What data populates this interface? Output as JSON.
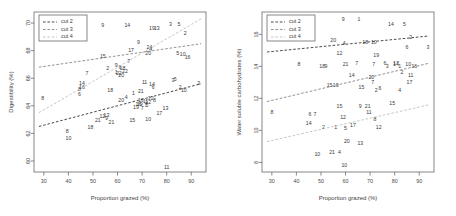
{
  "figure": {
    "panel_count": 2,
    "background": "#ffffff"
  },
  "legend": {
    "items": [
      {
        "label": "cut 2",
        "color": "#2b2b2b"
      },
      {
        "label": "cut 3",
        "color": "#7d7d7d"
      },
      {
        "label": "cut 4",
        "color": "#bcbcbc"
      }
    ]
  },
  "chart_data": [
    {
      "type": "scatter",
      "panel": "left",
      "title": "",
      "xlabel": "Proportion grazed (%)",
      "ylabel": "Digestibility (%)",
      "xlim": [
        26,
        96
      ],
      "ylim": [
        59.2,
        70.8
      ],
      "xticks": [
        30,
        40,
        50,
        60,
        70,
        80,
        90
      ],
      "yticks": [
        60,
        62,
        64,
        66,
        68,
        70
      ],
      "grid": false,
      "legend_position": "top-left",
      "point_label_mode": "numeric-id",
      "series": [
        {
          "name": "cut 2",
          "color": "#2b2b2b",
          "points": [
            {
              "label": "8",
              "x": 39.5,
              "y": 62.1
            },
            {
              "label": "18",
              "x": 49.0,
              "y": 62.4
            },
            {
              "label": "21",
              "x": 57.5,
              "y": 62.8
            },
            {
              "label": "12",
              "x": 53.8,
              "y": 63.2
            },
            {
              "label": "9",
              "x": 55.5,
              "y": 63.1
            },
            {
              "label": "15",
              "x": 66.0,
              "y": 62.9
            },
            {
              "label": "10",
              "x": 72.5,
              "y": 63.0
            },
            {
              "label": "17",
              "x": 77.0,
              "y": 63.4
            },
            {
              "label": "13",
              "x": 79.5,
              "y": 63.8
            },
            {
              "label": "19",
              "x": 67.5,
              "y": 63.9
            },
            {
              "label": "16",
              "x": 68.5,
              "y": 64.1
            },
            {
              "label": "7",
              "x": 70.0,
              "y": 63.8
            },
            {
              "label": "5",
              "x": 72.0,
              "y": 64.0
            },
            {
              "label": "12",
              "x": 72.5,
              "y": 64.2
            },
            {
              "label": "11",
              "x": 71.5,
              "y": 64.3
            },
            {
              "label": "20",
              "x": 61.5,
              "y": 64.4
            },
            {
              "label": "4",
              "x": 63.5,
              "y": 64.6
            },
            {
              "label": "1",
              "x": 66.5,
              "y": 64.9
            },
            {
              "label": "21",
              "x": 69.5,
              "y": 65.0
            },
            {
              "label": "14",
              "x": 74.0,
              "y": 65.5
            },
            {
              "label": "6",
              "x": 74.5,
              "y": 65.3
            },
            {
              "label": "11",
              "x": 71.0,
              "y": 65.7
            },
            {
              "label": "3",
              "x": 82.5,
              "y": 65.8
            },
            {
              "label": "5",
              "x": 83.5,
              "y": 65.9
            },
            {
              "label": "2",
              "x": 85.5,
              "y": 65.3
            },
            {
              "label": "10",
              "x": 87.0,
              "y": 65.1
            },
            {
              "label": "3",
              "x": 93.0,
              "y": 65.6
            },
            {
              "label": "11",
              "x": 80.0,
              "y": 59.5
            }
          ]
        },
        {
          "name": "cut 3",
          "color": "#7d7d7d",
          "points": [
            {
              "label": "8",
              "x": 29.5,
              "y": 64.5
            },
            {
              "label": "8",
              "x": 44.5,
              "y": 65.2
            },
            {
              "label": "14",
              "x": 45.5,
              "y": 65.6
            },
            {
              "label": "7",
              "x": 47.5,
              "y": 66.3
            },
            {
              "label": "2",
              "x": 56.0,
              "y": 66.7
            },
            {
              "label": "9",
              "x": 59.5,
              "y": 66.9
            },
            {
              "label": "15",
              "x": 54.0,
              "y": 67.6
            },
            {
              "label": "7",
              "x": 64.5,
              "y": 67.2
            },
            {
              "label": "17",
              "x": 65.5,
              "y": 68.0
            },
            {
              "label": "9",
              "x": 68.5,
              "y": 68.6
            },
            {
              "label": "20",
              "x": 72.5,
              "y": 67.8
            },
            {
              "label": "4",
              "x": 73.5,
              "y": 68.1
            },
            {
              "label": "5",
              "x": 84.5,
              "y": 67.8
            },
            {
              "label": "10",
              "x": 86.5,
              "y": 67.7
            },
            {
              "label": "16",
              "x": 88.5,
              "y": 67.5
            },
            {
              "label": "2",
              "x": 87.5,
              "y": 69.2
            },
            {
              "label": "19",
              "x": 74.0,
              "y": 69.6
            },
            {
              "label": "13",
              "x": 76.0,
              "y": 69.6
            },
            {
              "label": "9",
              "x": 54.0,
              "y": 69.8
            },
            {
              "label": "14",
              "x": 64.0,
              "y": 69.8
            },
            {
              "label": "3",
              "x": 81.5,
              "y": 69.9
            },
            {
              "label": "5",
              "x": 85.0,
              "y": 69.9
            },
            {
              "label": "6",
              "x": 61.0,
              "y": 66.8
            },
            {
              "label": "18",
              "x": 62.0,
              "y": 66.7
            },
            {
              "label": "22",
              "x": 63.0,
              "y": 66.5
            }
          ]
        },
        {
          "name": "cut 4",
          "color": "#bcbcbc",
          "points": [
            {
              "label": "10",
              "x": 40.0,
              "y": 61.6
            },
            {
              "label": "21",
              "x": 52.0,
              "y": 62.9
            },
            {
              "label": "6",
              "x": 44.5,
              "y": 64.8
            },
            {
              "label": "16",
              "x": 45.5,
              "y": 65.3
            },
            {
              "label": "18",
              "x": 57.0,
              "y": 65.1
            },
            {
              "label": "20",
              "x": 61.5,
              "y": 66.2
            },
            {
              "label": "1",
              "x": 59.5,
              "y": 66.4
            },
            {
              "label": "22",
              "x": 60.5,
              "y": 66.3
            },
            {
              "label": "13",
              "x": 55.5,
              "y": 63.3
            },
            {
              "label": "16",
              "x": 69.5,
              "y": 64.4
            },
            {
              "label": "19",
              "x": 69.0,
              "y": 64.1
            },
            {
              "label": "12",
              "x": 73.5,
              "y": 64.5
            },
            {
              "label": "7",
              "x": 71.5,
              "y": 64.0
            },
            {
              "label": "8",
              "x": 75.0,
              "y": 64.4
            },
            {
              "label": "24",
              "x": 73.0,
              "y": 68.2
            }
          ]
        }
      ],
      "fit_lines": [
        {
          "name": "cut 2",
          "color": "#2b2b2b",
          "x1": 28,
          "y1": 62.5,
          "x2": 94,
          "y2": 65.6
        },
        {
          "name": "cut 3",
          "color": "#7d7d7d",
          "x1": 28,
          "y1": 66.8,
          "x2": 94,
          "y2": 68.5
        },
        {
          "name": "cut 4",
          "color": "#bcbcbc",
          "x1": 28,
          "y1": 63.5,
          "x2": 94,
          "y2": 70.3
        }
      ]
    },
    {
      "type": "scatter",
      "panel": "right",
      "title": "",
      "xlabel": "Proportion grazed (%)",
      "ylabel": "Water soluble carbohydrates (%)",
      "xlim": [
        26,
        96
      ],
      "ylim": [
        7.4,
        17.4
      ],
      "xticks": [
        30,
        40,
        50,
        60,
        70,
        80,
        90
      ],
      "yticks": [
        8,
        10,
        12,
        14,
        16
      ],
      "grid": false,
      "legend_position": "top-left",
      "point_label_mode": "numeric-id",
      "series": [
        {
          "name": "cut 2",
          "color": "#2b2b2b",
          "points": [
            {
              "label": "8",
              "x": 41.0,
              "y": 14.1
            },
            {
              "label": "18",
              "x": 50.5,
              "y": 14.0
            },
            {
              "label": "9",
              "x": 52.0,
              "y": 14.0
            },
            {
              "label": "21",
              "x": 60.0,
              "y": 14.1
            },
            {
              "label": "12",
              "x": 57.5,
              "y": 14.8
            },
            {
              "label": "20",
              "x": 55.0,
              "y": 15.6
            },
            {
              "label": "4",
              "x": 59.5,
              "y": 15.4
            },
            {
              "label": "9",
              "x": 59.0,
              "y": 16.9
            },
            {
              "label": "1",
              "x": 65.5,
              "y": 16.9
            },
            {
              "label": "10",
              "x": 71.5,
              "y": 15.5
            },
            {
              "label": "18",
              "x": 68.0,
              "y": 15.5
            },
            {
              "label": "19",
              "x": 72.5,
              "y": 14.7
            },
            {
              "label": "14",
              "x": 78.5,
              "y": 16.6
            },
            {
              "label": "5",
              "x": 84.0,
              "y": 16.6
            },
            {
              "label": "2",
              "x": 86.5,
              "y": 15.8
            },
            {
              "label": "6",
              "x": 85.0,
              "y": 15.2
            },
            {
              "label": "3",
              "x": 93.5,
              "y": 15.2
            },
            {
              "label": "7",
              "x": 64.5,
              "y": 14.2
            },
            {
              "label": "7",
              "x": 71.5,
              "y": 14.1
            },
            {
              "label": "6",
              "x": 76.0,
              "y": 14.2
            },
            {
              "label": "3",
              "x": 77.0,
              "y": 14.0
            },
            {
              "label": "17",
              "x": 80.5,
              "y": 14.2
            },
            {
              "label": "14",
              "x": 80.5,
              "y": 14.1
            },
            {
              "label": "1",
              "x": 82.0,
              "y": 14.0
            },
            {
              "label": "10",
              "x": 85.5,
              "y": 14.1
            },
            {
              "label": "16",
              "x": 88.0,
              "y": 14.0
            },
            {
              "label": "11",
              "x": 86.5,
              "y": 13.4
            },
            {
              "label": "17",
              "x": 86.0,
              "y": 13.0
            },
            {
              "label": "2",
              "x": 83.0,
              "y": 13.6
            },
            {
              "label": "14",
              "x": 62.5,
              "y": 13.4
            },
            {
              "label": "20",
              "x": 70.5,
              "y": 13.3
            },
            {
              "label": "7",
              "x": 71.0,
              "y": 13.0
            },
            {
              "label": "15",
              "x": 66.5,
              "y": 12.7
            },
            {
              "label": "2",
              "x": 72.5,
              "y": 12.5
            },
            {
              "label": "6",
              "x": 74.0,
              "y": 12.6
            },
            {
              "label": "4",
              "x": 82.0,
              "y": 12.5
            },
            {
              "label": "8",
              "x": 30.0,
              "y": 11.1
            },
            {
              "label": "15",
              "x": 53.5,
              "y": 12.8
            },
            {
              "label": "19",
              "x": 56.0,
              "y": 12.8
            }
          ]
        },
        {
          "name": "cut 3",
          "color": "#7d7d7d",
          "points": [
            {
              "label": "15",
              "x": 79.0,
              "y": 11.7
            },
            {
              "label": "9",
              "x": 66.0,
              "y": 11.5
            },
            {
              "label": "21",
              "x": 69.0,
              "y": 11.5
            },
            {
              "label": "11",
              "x": 69.5,
              "y": 11.1
            },
            {
              "label": "8",
              "x": 72.0,
              "y": 10.7
            },
            {
              "label": "12",
              "x": 73.5,
              "y": 10.2
            },
            {
              "label": "15",
              "x": 57.5,
              "y": 11.5
            },
            {
              "label": "12",
              "x": 59.0,
              "y": 10.8
            },
            {
              "label": "6",
              "x": 45.5,
              "y": 11.0
            },
            {
              "label": "7",
              "x": 47.5,
              "y": 11.0
            },
            {
              "label": "14",
              "x": 45.0,
              "y": 10.4
            },
            {
              "label": "2",
              "x": 51.0,
              "y": 10.2
            },
            {
              "label": "1",
              "x": 56.0,
              "y": 10.2
            },
            {
              "label": "5",
              "x": 60.0,
              "y": 10.1
            },
            {
              "label": "17",
              "x": 63.0,
              "y": 10.3
            },
            {
              "label": "20",
              "x": 60.5,
              "y": 9.3
            },
            {
              "label": "13",
              "x": 66.0,
              "y": 9.2
            },
            {
              "label": "10",
              "x": 48.5,
              "y": 8.5
            },
            {
              "label": "21",
              "x": 54.5,
              "y": 8.6
            },
            {
              "label": "4",
              "x": 57.5,
              "y": 8.6
            },
            {
              "label": "10",
              "x": 59.5,
              "y": 7.8
            }
          ]
        },
        {
          "name": "cut 4",
          "color": "#bcbcbc",
          "points": []
        }
      ],
      "fit_lines": [
        {
          "name": "cut 2",
          "color": "#2b2b2b",
          "x1": 28,
          "y1": 14.9,
          "x2": 94,
          "y2": 15.9
        },
        {
          "name": "cut 3",
          "color": "#7d7d7d",
          "x1": 28,
          "y1": 11.8,
          "x2": 94,
          "y2": 14.2
        },
        {
          "name": "cut 4",
          "color": "#bcbcbc",
          "x1": 28,
          "y1": 9.3,
          "x2": 94,
          "y2": 11.6
        }
      ]
    }
  ]
}
